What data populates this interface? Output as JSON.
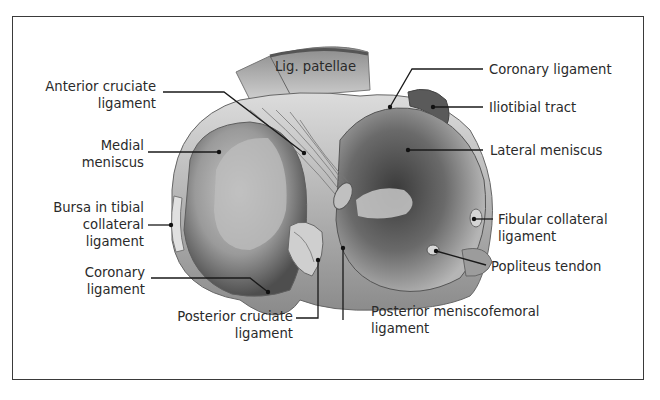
{
  "figure": {
    "labels": {
      "lig_patellae": "Lig. patellae",
      "acl_1": "Anterior cruciate",
      "acl_2": "ligament",
      "medial_1": "Medial",
      "medial_2": "meniscus",
      "bursa_1": "Bursa in tibial",
      "bursa_2": "collateral",
      "bursa_3": "ligament",
      "coronary_left_1": "Coronary",
      "coronary_left_2": "ligament",
      "pcl_1": "Posterior cruciate",
      "pcl_2": "ligament",
      "pmfl_1": "Posterior meniscofemoral",
      "pmfl_2": "ligament",
      "coronary_right": "Coronary ligament",
      "iliotibial": "Iliotibial tract",
      "lateral": "Lateral meniscus",
      "fibular_1": "Fibular collateral",
      "fibular_2": "ligament",
      "popliteus": "Popliteus tendon"
    },
    "colors": {
      "frame": "#3a3a3a",
      "leader": "#1a1a1a",
      "tissue_light": "#d9d9d9",
      "tissue_mid": "#a8a8a8",
      "tissue_dark": "#4a4a4a"
    }
  }
}
